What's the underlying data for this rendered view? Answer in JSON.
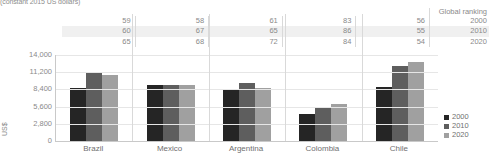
{
  "subtitle": "(constant 2015 US dollars)",
  "ranking_table": {
    "header": "Global ranking",
    "years": [
      "2000",
      "2010",
      "2020"
    ],
    "rows": [
      {
        "year": "2000",
        "values": [
          "59",
          "58",
          "61",
          "83",
          "56"
        ]
      },
      {
        "year": "2010",
        "values": [
          "60",
          "67",
          "65",
          "86",
          "55"
        ]
      },
      {
        "year": "2020",
        "values": [
          "65",
          "68",
          "72",
          "84",
          "54"
        ]
      }
    ]
  },
  "legend": {
    "items": [
      {
        "label": "2000",
        "color": "#252525"
      },
      {
        "label": "2010",
        "color": "#5e5e5e"
      },
      {
        "label": "2020",
        "color": "#a0a0a0"
      }
    ]
  },
  "chart_data": {
    "type": "bar",
    "title": "",
    "subtitle": "(constant 2015 US dollars)",
    "xlabel": "",
    "ylabel": "US$",
    "ylim": [
      0,
      14000
    ],
    "yticks": [
      0,
      2800,
      5600,
      8400,
      11200,
      14000
    ],
    "ytick_labels": [
      "0",
      "2,800",
      "5,600",
      "8,400",
      "11,200",
      "14,000"
    ],
    "grid": true,
    "legend_position": "right",
    "categories": [
      "Brazil",
      "Mexico",
      "Argentina",
      "Colombia",
      "Chile"
    ],
    "series": [
      {
        "name": "2000",
        "color": "#252525",
        "values": [
          8700,
          9100,
          8300,
          4400,
          8800
        ]
      },
      {
        "name": "2010",
        "color": "#5e5e5e",
        "values": [
          11200,
          9150,
          9400,
          5500,
          12200
        ]
      },
      {
        "name": "2020",
        "color": "#a0a0a0",
        "values": [
          10800,
          9150,
          8600,
          6100,
          12800
        ]
      }
    ],
    "annotations": {
      "global_ranking": {
        "label": "Global ranking",
        "Brazil": {
          "2000": 59,
          "2010": 60,
          "2020": 65
        },
        "Mexico": {
          "2000": 58,
          "2010": 67,
          "2020": 68
        },
        "Argentina": {
          "2000": 61,
          "2010": 65,
          "2020": 72
        },
        "Colombia": {
          "2000": 83,
          "2010": 86,
          "2020": 84
        },
        "Chile": {
          "2000": 56,
          "2010": 55,
          "2020": 54
        }
      }
    }
  }
}
